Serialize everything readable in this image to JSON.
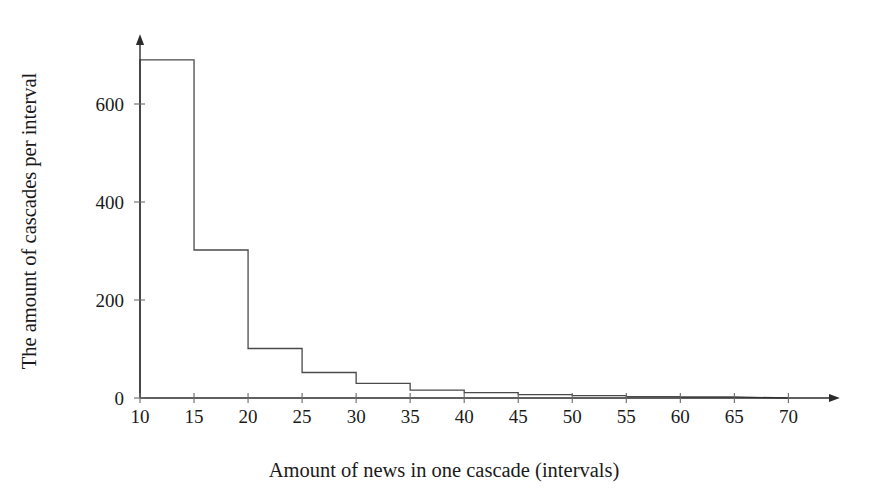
{
  "chart_data": {
    "type": "bar",
    "title": "",
    "subtitle": "",
    "xlabel": "Amount of news in one cascade (intervals)",
    "ylabel": "The amount of cascades per interval",
    "grid": false,
    "legend": false,
    "legend_position": "none",
    "xlim": [
      10,
      72
    ],
    "ylim": [
      0,
      700
    ],
    "xticks": [
      10,
      15,
      20,
      25,
      30,
      35,
      40,
      45,
      50,
      55,
      60,
      65,
      70
    ],
    "xtick_labels": [
      "10",
      "15",
      "20",
      "25",
      "30",
      "35",
      "40",
      "45",
      "50",
      "55",
      "60",
      "65",
      "70"
    ],
    "yticks": [
      0,
      200,
      400,
      600
    ],
    "ytick_labels": [
      "0",
      "200",
      "400",
      "600"
    ],
    "bin_width": 5,
    "bin_edges": [
      10,
      15,
      20,
      25,
      30,
      35,
      40,
      45,
      50,
      55,
      60,
      65
    ],
    "categories": [
      "10-15",
      "15-20",
      "20-25",
      "25-30",
      "30-35",
      "35-40",
      "40-45",
      "45-50",
      "50-55",
      "55-60",
      "60-65"
    ],
    "values": [
      690,
      302,
      101,
      52,
      30,
      16,
      11,
      7,
      5,
      3,
      2
    ],
    "series": [
      {
        "name": "cascades per interval",
        "values": [
          690,
          302,
          101,
          52,
          30,
          16,
          11,
          7,
          5,
          3,
          2
        ]
      }
    ],
    "annotations": [],
    "colors": {
      "stroke": "#4a4a4a",
      "axis": "#2b2b2b",
      "text": "#1a1a1a",
      "background": "#ffffff"
    }
  },
  "axes": {
    "x_axis_label": "Amount of news in one cascade (intervals)",
    "y_axis_label": "The amount of cascades per interval",
    "x_arrow": true,
    "y_arrow": true
  }
}
